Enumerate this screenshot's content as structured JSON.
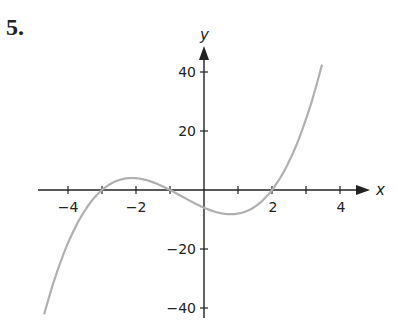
{
  "problem_number": "5.",
  "chart_data": {
    "type": "line",
    "title": "",
    "xlabel": "x",
    "ylabel": "y",
    "xlim": [
      -4.8,
      5
    ],
    "ylim": [
      -42,
      48
    ],
    "grid": false,
    "legend": null,
    "x_ticks": [
      -4,
      -3,
      -2,
      -1,
      1,
      2,
      3,
      4
    ],
    "x_tick_labels": [
      "-4",
      "-2",
      "2",
      "4"
    ],
    "y_ticks": [
      40,
      20,
      -20,
      -40
    ],
    "y_tick_labels": [
      "40",
      "20",
      "−20",
      "−40"
    ],
    "function": "y = (x+3)(x+1)(x-2)",
    "roots": [
      -3,
      -1,
      2
    ],
    "series": [
      {
        "name": "curve",
        "color": "#b0b0b0",
        "x": [
          -4.7,
          -4.5,
          -4,
          -3.5,
          -3,
          -2.5,
          -2,
          -1.5,
          -1,
          -0.5,
          0,
          0.5,
          1,
          1.5,
          2,
          2.5,
          3,
          3.47
        ],
        "y": [
          -42.1,
          -33.0,
          -15.0,
          -4.1,
          0,
          3.4,
          4.0,
          2.6,
          0,
          -2.8,
          -6.0,
          -6.1,
          -8.0,
          -5.6,
          0,
          6.8,
          24.0,
          39.2
        ]
      }
    ]
  },
  "labels": {
    "x_axis": "x",
    "y_axis": "y",
    "xt_m4": "−4",
    "xt_m2": "−2",
    "xt_2": "2",
    "xt_4": "4",
    "yt_40": "40",
    "yt_20": "20",
    "yt_m20": "−20",
    "yt_m40": "−40"
  }
}
